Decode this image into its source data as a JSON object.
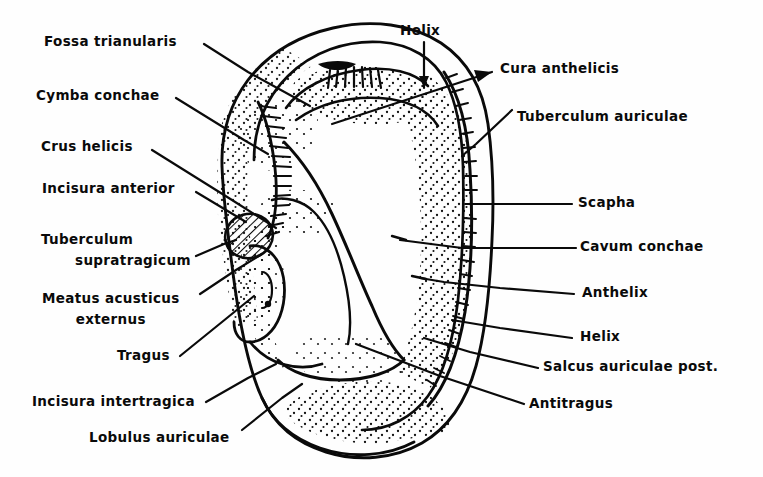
{
  "figure": {
    "type": "labeled-anatomical-line-drawing",
    "background_color": "#fefefe",
    "ink_color": "#0a0a0a"
  },
  "labels": {
    "fossa_trianularis": "Fossa trianularis",
    "cymba_conchae": "Cymba conchae",
    "crus_helicis": "Crus helicis",
    "incisura_anterior": "Incisura anterior",
    "tuberculum_supratragicum_l1": "Tuberculum",
    "tuberculum_supratragicum_l2": "supratragicum",
    "meatus_acusticus_externus_l1": "Meatus acusticus",
    "meatus_acusticus_externus_l2": "externus",
    "tragus": "Tragus",
    "incisura_intertragica": "Incisura intertragica",
    "lobulus_auriculae": "Lobulus auriculae",
    "helix_top": "Helix",
    "cura_anthelicis": "Cura anthelicis",
    "tuberculum_auriculae": "Tuberculum auriculae",
    "scapha": "Scapha",
    "cavum_conchae": "Cavum conchae",
    "anthelix": "Anthelix",
    "helix_right": "Helix",
    "salcus_auriculae_post": "Salcus auriculae post.",
    "antitragus": "Antitragus"
  }
}
